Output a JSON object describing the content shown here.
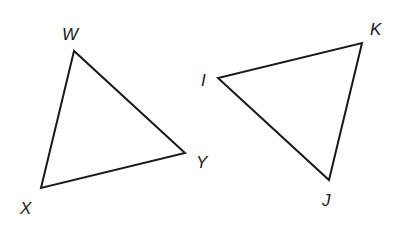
{
  "diagram": {
    "triangles": [
      {
        "name": "WXY",
        "vertices": [
          {
            "label": "W",
            "x": 74,
            "y": 51,
            "lx": 62,
            "ly": 40
          },
          {
            "label": "X",
            "x": 41,
            "y": 188,
            "lx": 20,
            "ly": 214
          },
          {
            "label": "Y",
            "x": 185,
            "y": 153,
            "lx": 196,
            "ly": 168
          }
        ]
      },
      {
        "name": "IJK",
        "vertices": [
          {
            "label": "I",
            "x": 218,
            "y": 78,
            "lx": 201,
            "ly": 86
          },
          {
            "label": "J",
            "x": 329,
            "y": 180,
            "lx": 322,
            "ly": 206
          },
          {
            "label": "K",
            "x": 362,
            "y": 43,
            "lx": 370,
            "ly": 35
          }
        ]
      }
    ],
    "stroke_color": "#1a1a1a"
  }
}
